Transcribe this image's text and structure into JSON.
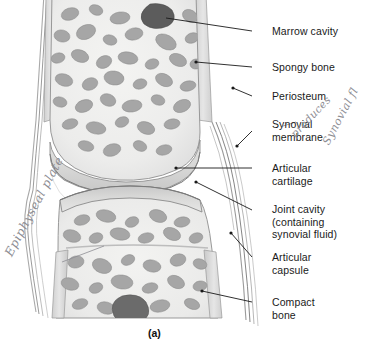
{
  "figure": {
    "caption": "(a)",
    "background_color": "#ffffff",
    "line_color": "#1a1a1a",
    "text_color": "#1a1a1a",
    "handwriting_color": "#8d8d93"
  },
  "labels": [
    {
      "id": "marrow-cavity",
      "lines": [
        "Marrow cavity"
      ],
      "x": 272,
      "y": 25,
      "leader": {
        "x1": 252,
        "y1": 31,
        "x2": 166,
        "y2": 18,
        "dot": false
      }
    },
    {
      "id": "spongy-bone",
      "lines": [
        "Spongy bone"
      ],
      "x": 272,
      "y": 61,
      "leader": {
        "x1": 252,
        "y1": 67,
        "x2": 196,
        "y2": 62,
        "dot": true
      }
    },
    {
      "id": "periosteum",
      "lines": [
        "Periosteum"
      ],
      "x": 272,
      "y": 90,
      "leader": {
        "x1": 252,
        "y1": 96,
        "x2": 233,
        "y2": 88,
        "dot": true
      }
    },
    {
      "id": "synovial-membrane",
      "lines": [
        "Synovial",
        "membrane"
      ],
      "x": 272,
      "y": 118,
      "leader": {
        "x1": 252,
        "y1": 131,
        "x2": 237,
        "y2": 146,
        "dot": true
      }
    },
    {
      "id": "articular-cartilage",
      "lines": [
        "Articular",
        "cartilage"
      ],
      "x": 272,
      "y": 162,
      "leader": {
        "x1": 252,
        "y1": 168,
        "x2": 176,
        "y2": 168,
        "dot": true
      }
    },
    {
      "id": "joint-cavity",
      "lines": [
        "Joint cavity",
        "(containing",
        "synovial fluid)"
      ],
      "x": 272,
      "y": 203,
      "leader": {
        "x1": 252,
        "y1": 210,
        "x2": 196,
        "y2": 182,
        "dot": true
      }
    },
    {
      "id": "articular-capsule",
      "lines": [
        "Articular",
        "capsule"
      ],
      "x": 272,
      "y": 251,
      "leader": {
        "x1": 252,
        "y1": 257,
        "x2": 231,
        "y2": 233,
        "dot": true
      }
    },
    {
      "id": "compact-bone",
      "lines": [
        "Compact",
        "bone"
      ],
      "x": 272,
      "y": 296,
      "leader": {
        "x1": 252,
        "y1": 302,
        "x2": 202,
        "y2": 291,
        "dot": true
      }
    }
  ],
  "annotations": [
    {
      "id": "epiphyseal-plate-note",
      "text": "Epiphyseal plate"
    },
    {
      "id": "produces-note",
      "text": "produces"
    },
    {
      "id": "synovial-fluid-note",
      "text": "Synovial fl"
    }
  ],
  "annotation_leaders": [
    {
      "id": "epiphyseal-leader",
      "x1": 62,
      "y1": 262,
      "x2": 104,
      "y2": 246
    },
    {
      "id": "synovial-note-leader",
      "x1": 283,
      "y1": 126,
      "x2": 296,
      "y2": 122
    }
  ]
}
